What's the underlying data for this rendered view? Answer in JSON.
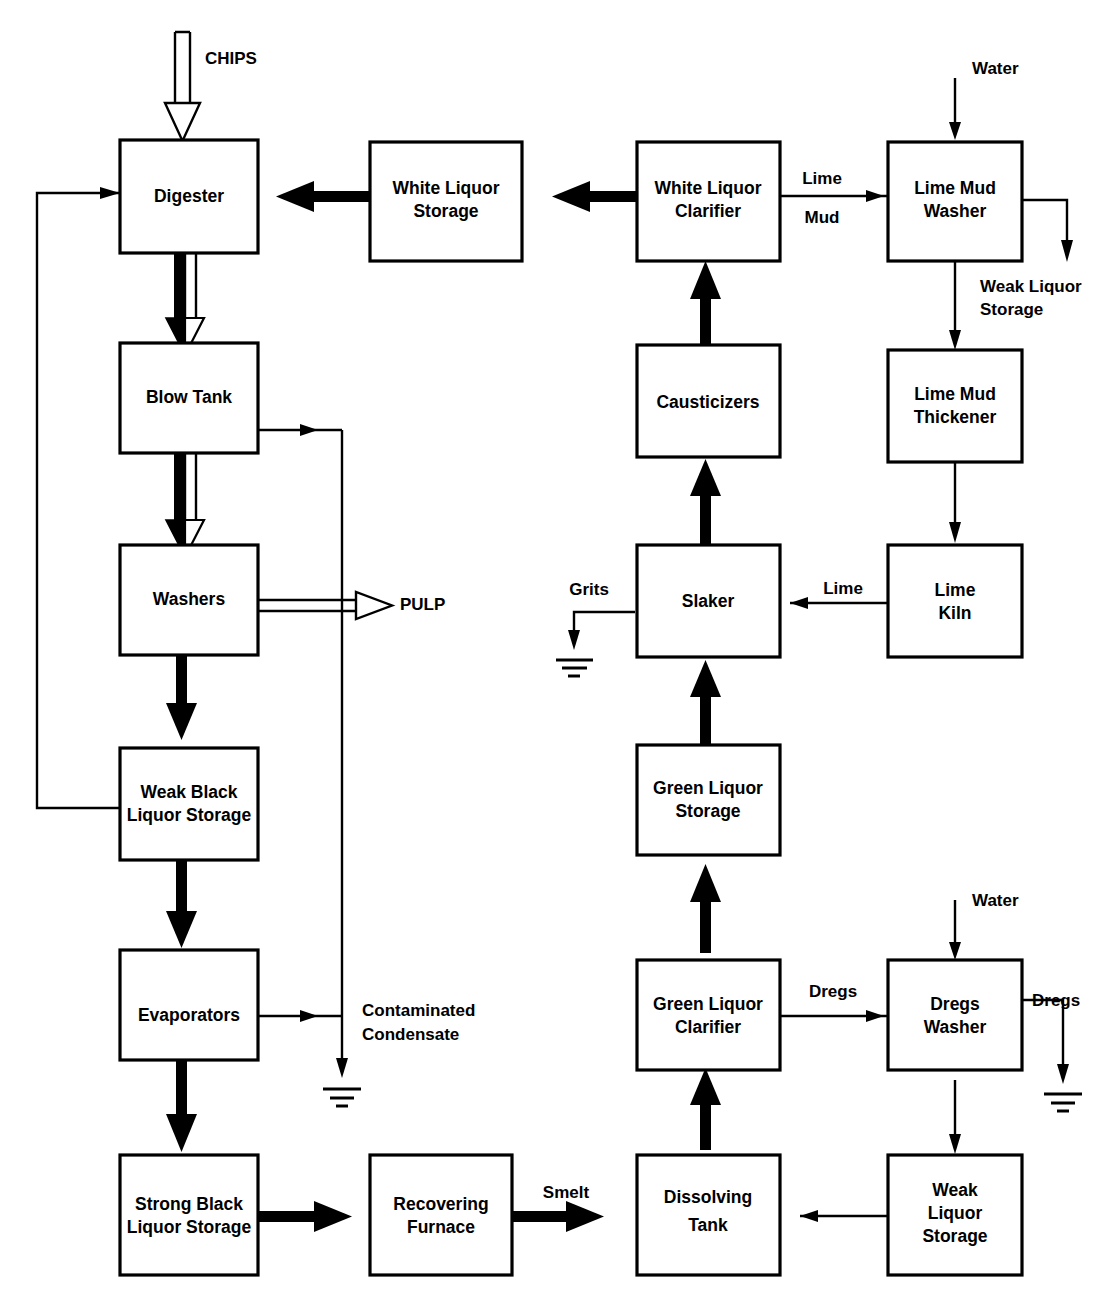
{
  "diagram": {
    "background_color": "#ffffff",
    "line_color": "#000000"
  },
  "nodes": [
    {
      "id": "digester",
      "label": "Digester",
      "lines": [
        "Digester"
      ]
    },
    {
      "id": "blow_tank",
      "label": "Blow Tank",
      "lines": [
        "Blow Tank"
      ]
    },
    {
      "id": "washers",
      "label": "Washers",
      "lines": [
        "Washers"
      ]
    },
    {
      "id": "weak_black",
      "label": "Weak Black Liquor Storage",
      "lines": [
        "Weak Black",
        "Liquor Storage"
      ]
    },
    {
      "id": "evaporators",
      "label": "Evaporators",
      "lines": [
        "Evaporators"
      ]
    },
    {
      "id": "strong_black",
      "label": "Strong Black Liquor Storage",
      "lines": [
        "Strong Black",
        "Liquor Storage"
      ]
    },
    {
      "id": "recovering",
      "label": "Recovering Furnace",
      "lines": [
        "Recovering",
        "Furnace"
      ]
    },
    {
      "id": "dissolving",
      "label": "Dissolving Tank",
      "lines": [
        "Dissolving",
        "Tank"
      ]
    },
    {
      "id": "weak_liquor",
      "label": "Weak Liquor Storage",
      "lines": [
        "Weak",
        "Liquor",
        "Storage"
      ]
    },
    {
      "id": "green_clarifier",
      "label": "Green Liquor Clarifier",
      "lines": [
        "Green Liquor",
        "Clarifier"
      ]
    },
    {
      "id": "dregs_washer",
      "label": "Dregs Washer",
      "lines": [
        "Dregs",
        "Washer"
      ]
    },
    {
      "id": "green_storage",
      "label": "Green Liquor Storage",
      "lines": [
        "Green Liquor",
        "Storage"
      ]
    },
    {
      "id": "slaker",
      "label": "Slaker",
      "lines": [
        "Slaker"
      ]
    },
    {
      "id": "lime_kiln",
      "label": "Lime Kiln",
      "lines": [
        "Lime",
        "Kiln"
      ]
    },
    {
      "id": "causticizers",
      "label": "Causticizers",
      "lines": [
        "Causticizers"
      ]
    },
    {
      "id": "lime_thickener",
      "label": "Lime Mud Thickener",
      "lines": [
        "Lime Mud",
        "Thickener"
      ]
    },
    {
      "id": "white_clarifier",
      "label": "White Liquor Clarifier",
      "lines": [
        "White Liquor",
        "Clarifier"
      ]
    },
    {
      "id": "lime_washer",
      "label": "Lime Mud Washer",
      "lines": [
        "Lime Mud",
        "Washer"
      ]
    },
    {
      "id": "white_storage",
      "label": "White Liquor Storage",
      "lines": [
        "White Liquor",
        "Storage"
      ]
    }
  ],
  "stream_labels": [
    {
      "id": "chips",
      "text": "CHIPS"
    },
    {
      "id": "pulp",
      "text": "PULP"
    },
    {
      "id": "contaminated_condensate",
      "text": "Contaminated"
    },
    {
      "id": "condensate_line2",
      "text": "Condensate"
    },
    {
      "id": "smelt",
      "text": "Smelt"
    },
    {
      "id": "dregs_out_clarifier",
      "text": "Dregs"
    },
    {
      "id": "dregs_out_washer",
      "text": "Dregs"
    },
    {
      "id": "water_dregs",
      "text": "Water"
    },
    {
      "id": "water_lime",
      "text": "Water"
    },
    {
      "id": "grits",
      "text": "Grits"
    },
    {
      "id": "lime_kiln_out",
      "text": "Lime"
    },
    {
      "id": "lime_mud_1",
      "text": "Lime"
    },
    {
      "id": "lime_mud_2",
      "text": "Mud"
    },
    {
      "id": "weak_liquor_store_1",
      "text": "Weak Liquor"
    },
    {
      "id": "weak_liquor_store_2",
      "text": "Storage"
    }
  ],
  "legend_notes": {
    "thick_solid": "liquor / chemical stream",
    "hollow": "fiber / pulp stream",
    "thin": "water, condensate and waste stream"
  }
}
